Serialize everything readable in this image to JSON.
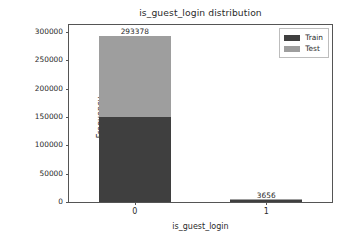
{
  "chart_data": {
    "type": "bar",
    "subtype": "stacked-bar",
    "title": "is_guest_login distribution",
    "xlabel": "is_guest_login",
    "ylabel": "Frequency",
    "categories": [
      "0",
      "1"
    ],
    "series": [
      {
        "name": "Train",
        "color": "#3f3f3f",
        "values": [
          149000,
          3550
        ]
      },
      {
        "name": "Test",
        "color": "#9e9e9e",
        "values": [
          144378,
          106
        ]
      }
    ],
    "totals": [
      293378,
      3656
    ],
    "bar_labels": [
      "293378",
      "3656"
    ],
    "ylim": [
      0,
      312000
    ],
    "yticks": [
      0,
      50000,
      100000,
      150000,
      200000,
      250000,
      300000
    ],
    "ytick_labels": [
      "0",
      "50000",
      "100000",
      "150000",
      "200000",
      "250000",
      "300000"
    ],
    "grid": false,
    "legend_position": "upper right"
  },
  "legend": {
    "entries": [
      {
        "label": "Train",
        "color": "#3f3f3f"
      },
      {
        "label": "Test",
        "color": "#9e9e9e"
      }
    ]
  }
}
